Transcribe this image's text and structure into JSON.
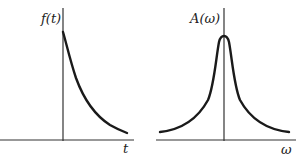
{
  "left_plot": {
    "y_label": "f(t)",
    "x_label": "t",
    "curve": "exponential-decay"
  },
  "right_plot": {
    "y_label": "A(ω)",
    "x_label": "ω",
    "curve": "lorentzian-peak"
  },
  "colors": {
    "line": "#1a1a1a",
    "background": "#ffffff"
  }
}
